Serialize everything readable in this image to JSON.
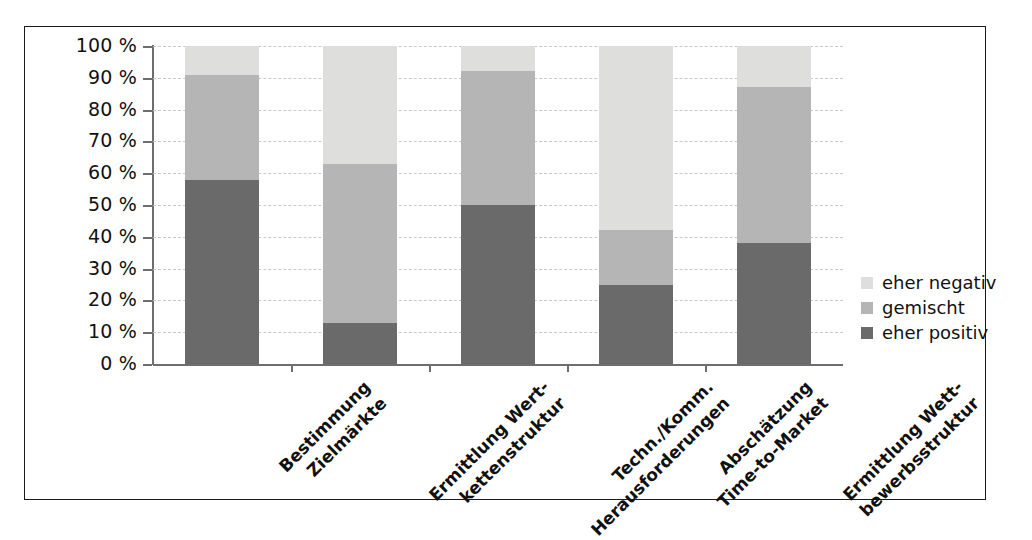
{
  "chart_data": {
    "type": "bar",
    "subtype": "stacked-100-percent",
    "title": "",
    "xlabel": "",
    "ylabel": "",
    "ylim": [
      0,
      100
    ],
    "grid": true,
    "legend_position": "right",
    "categories": [
      "Bestimmung Zielmärkte",
      "Ermittlung Wert-kettenstruktur",
      "Techn./Komm. Herausforderungen",
      "Abschätzung Time-to-Market",
      "Ermittlung Wett-bewerbsstruktur"
    ],
    "category_lines": [
      [
        "Bestimmung",
        "Zielmärkte"
      ],
      [
        "Ermittlung Wert-",
        "kettenstruktur"
      ],
      [
        "Techn./Komm.",
        "Herausforderungen"
      ],
      [
        "Abschätzung",
        "Time-to-Market"
      ],
      [
        "Ermittlung Wett-",
        "bewerbsstruktur"
      ]
    ],
    "series": [
      {
        "name": "eher positiv",
        "color": "#6a6a6a",
        "values": [
          58,
          13,
          50,
          25,
          38
        ]
      },
      {
        "name": "gemischt",
        "color": "#b5b5b5",
        "values": [
          33,
          50,
          42,
          17,
          49
        ]
      },
      {
        "name": "eher negativ",
        "color": "#dededc",
        "values": [
          9,
          37,
          8,
          58,
          13
        ]
      }
    ],
    "cumulative_tops": {
      "eher positiv": [
        58,
        13,
        50,
        25,
        38
      ],
      "gemischt": [
        91,
        63,
        92,
        42,
        87
      ],
      "eher negativ": [
        100,
        100,
        100,
        100,
        100
      ]
    },
    "yticks": [
      0,
      10,
      20,
      30,
      40,
      50,
      60,
      70,
      80,
      90,
      100
    ],
    "ytick_labels": [
      "0 %",
      "10 %",
      "20 %",
      "30 %",
      "40 %",
      "50 %",
      "60 %",
      "70 %",
      "80 %",
      "90 %",
      "100 %"
    ]
  },
  "legend": {
    "items": [
      {
        "label": "eher negativ",
        "color": "#dededc"
      },
      {
        "label": "gemischt",
        "color": "#b5b5b5"
      },
      {
        "label": "eher positiv",
        "color": "#6a6a6a"
      }
    ]
  },
  "colors": {
    "positive": "#6a6a6a",
    "mixed": "#b5b5b5",
    "negative": "#dededc",
    "axis": "#6e6e6e",
    "grid": "#c9c9c9",
    "frame": "#1a1a1a",
    "text": "#111111",
    "background": "#ffffff"
  }
}
